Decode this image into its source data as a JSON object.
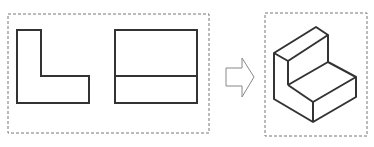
{
  "diagram": {
    "colors": {
      "stroke": "#333333",
      "dash": "#777777",
      "arrow": "#888888",
      "background": "#ffffff"
    },
    "panels": [
      {
        "name": "orthographic-views",
        "contents": [
          "L-shaped front view",
          "rectangular side view with horizontal divider"
        ]
      },
      {
        "name": "isometric-view",
        "contents": [
          "L-shaped block isometric drawing"
        ]
      }
    ],
    "arrow": {
      "direction": "right",
      "style": "outline"
    }
  }
}
